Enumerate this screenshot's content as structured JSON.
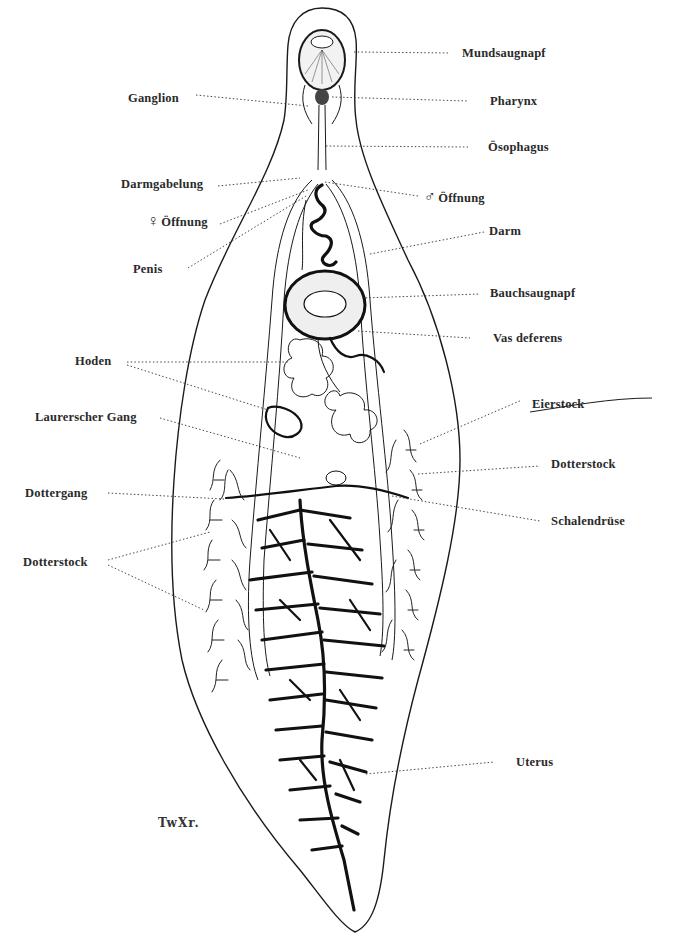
{
  "figure": {
    "type": "anatomical line drawing",
    "signature": "TwXr.",
    "caption_visible": "",
    "colors": {
      "ink": "#1a1a1a",
      "background": "#ffffff",
      "label": "#2a2a2a"
    }
  },
  "labels": {
    "left": [
      {
        "id": "ganglion",
        "text": "Ganglion"
      },
      {
        "id": "darmgabelung",
        "text": "Darmgabelung"
      },
      {
        "id": "female_opening",
        "symbol": "♀",
        "text": "Öffnung"
      },
      {
        "id": "penis",
        "text": "Penis"
      },
      {
        "id": "hoden",
        "text": "Hoden"
      },
      {
        "id": "laurerscher_gang",
        "text": "Laurerscher Gang"
      },
      {
        "id": "dottergang",
        "text": "Dottergang"
      },
      {
        "id": "dotterstock_left",
        "text": "Dotterstock"
      }
    ],
    "right": [
      {
        "id": "mundsaugnapf",
        "text": "Mundsaugnapf"
      },
      {
        "id": "pharynx",
        "text": "Pharynx"
      },
      {
        "id": "oesophagus",
        "text": "Ösophagus"
      },
      {
        "id": "male_opening",
        "symbol": "♂",
        "text": "Öffnung"
      },
      {
        "id": "darm",
        "text": "Darm"
      },
      {
        "id": "bauchsaugnapf",
        "text": "Bauchsaugnapf"
      },
      {
        "id": "vas_deferens",
        "text": "Vas deferens"
      },
      {
        "id": "eierstock",
        "text": "Eierstock"
      },
      {
        "id": "dotterstock_right",
        "text": "Dotterstock"
      },
      {
        "id": "schalendruese",
        "text": "Schalendrüse"
      },
      {
        "id": "uterus",
        "text": "Uterus"
      }
    ]
  }
}
